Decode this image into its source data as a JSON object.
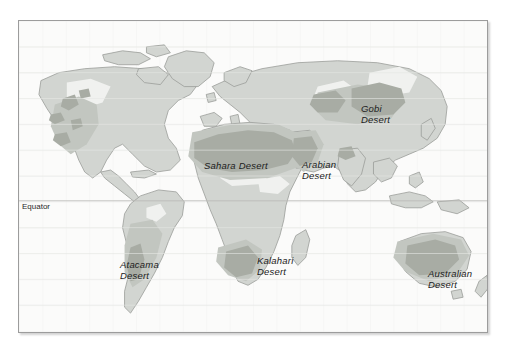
{
  "figure": {
    "kind": "world-map",
    "background_color": "#ffffff",
    "frame": {
      "border_color": "#9c9c9c",
      "fill_color": "#fbfbfa",
      "shadow": true
    }
  },
  "colors": {
    "ocean": "#fbfbfa",
    "land": "#d2d5d1",
    "land_outline": "#9a9d99",
    "semi_arid": "#c2c6c0",
    "desert": "#a8aca4",
    "desert_core": "#9aa096",
    "ice_highlight": "#f2f3f1",
    "graticule": "#ebebe8",
    "equator_line": "#b9b9b5",
    "label_text": "#1c1c1c"
  },
  "gridlines": {
    "visible": true,
    "equator_visible": true
  },
  "equator": {
    "label": "Equator"
  },
  "desert_labels": [
    {
      "id": "sahara",
      "line1": "Sahara Desert",
      "line2": ""
    },
    {
      "id": "arabian",
      "line1": "Arabian",
      "line2": "Desert"
    },
    {
      "id": "gobi",
      "line1": "Gobi",
      "line2": "Desert"
    },
    {
      "id": "atacama",
      "line1": "Atacama",
      "line2": "Desert"
    },
    {
      "id": "kalahari",
      "line1": "Kalahari",
      "line2": "Desert"
    },
    {
      "id": "australian",
      "line1": "Australian",
      "line2": "Desert"
    }
  ]
}
